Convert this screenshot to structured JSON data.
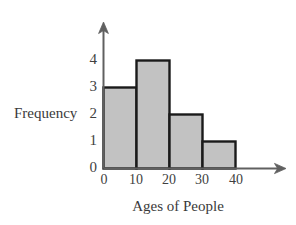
{
  "chart_data": {
    "type": "bar",
    "title": "",
    "xlabel": "Ages of People",
    "ylabel": "Frequency",
    "categories": [
      "0-10",
      "10-20",
      "20-30",
      "30-40"
    ],
    "values": [
      3,
      4,
      2,
      1
    ],
    "bin_edges": [
      0,
      10,
      20,
      30,
      40
    ],
    "x_tick_labels": [
      "0",
      "10",
      "20",
      "30",
      "40"
    ],
    "y_tick_labels": [
      "0",
      "1",
      "2",
      "3",
      "4"
    ],
    "xlim": [
      0,
      40
    ],
    "ylim": [
      0,
      4
    ],
    "grid": false,
    "legend": "none",
    "bar_fill_color": "#c2c2c2",
    "bar_border_color": "#1a1a1a",
    "axis_color": "#5a5a5a",
    "background_color": "#ffffff"
  },
  "axes": {
    "y_title": "Frequency",
    "x_title": "Ages of People",
    "y_ticks": [
      {
        "label": "4",
        "value": 4
      },
      {
        "label": "3",
        "value": 3
      },
      {
        "label": "2",
        "value": 2
      },
      {
        "label": "1",
        "value": 1
      },
      {
        "label": "0",
        "value": 0
      }
    ],
    "x_ticks": [
      {
        "label": "0",
        "value": 0
      },
      {
        "label": "10",
        "value": 10
      },
      {
        "label": "20",
        "value": 20
      },
      {
        "label": "30",
        "value": 30
      },
      {
        "label": "40",
        "value": 40
      }
    ]
  },
  "bars": [
    {
      "name": "bar-0-10",
      "start": "0",
      "end": "10",
      "frequency": "3"
    },
    {
      "name": "bar-10-20",
      "start": "10",
      "end": "20",
      "frequency": "4"
    },
    {
      "name": "bar-20-30",
      "start": "20",
      "end": "30",
      "frequency": "2"
    },
    {
      "name": "bar-30-40",
      "start": "30",
      "end": "40",
      "frequency": "1"
    }
  ]
}
